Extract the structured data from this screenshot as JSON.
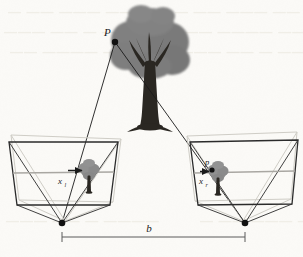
{
  "figure": {
    "type": "geometry-diagram",
    "background_color": "#fbfaf7",
    "width": 303,
    "height": 257
  },
  "labels": {
    "scene_point": "P",
    "image_point_right": "p",
    "baseline": "b",
    "disparity_left_base": "x",
    "disparity_left_sub": "l",
    "disparity_right_base": "x",
    "disparity_right_sub": "r"
  },
  "colors": {
    "ink": "#1a1a1a",
    "frustum_stroke": "#2b2b2b",
    "ghost_stroke": "#cfcdc6",
    "canopy_gray": "#7d7d7d",
    "canopy_gray_light": "#8d8d8d",
    "trunk_dark": "#2a2722",
    "axis_gray": "#a9a7a2",
    "baseline_stroke": "#5a5a5a",
    "paper": "#fbfaf7",
    "bleed": "#efede6"
  },
  "geometry": {
    "scene_point_xy": [
      115,
      42
    ],
    "tree_canopy_center": [
      150,
      46
    ],
    "tree_trunk_base": [
      150,
      126
    ],
    "left_camera_center": [
      62,
      223
    ],
    "right_camera_center": [
      245,
      223
    ],
    "baseline_y": 237,
    "baseline_x_start": 62,
    "baseline_x_end": 245,
    "left_frustum_box": [
      8,
      140,
      118,
      205
    ],
    "right_frustum_box": [
      190,
      140,
      298,
      205
    ],
    "left_image_tree_xy": [
      89,
      170
    ],
    "right_image_tree_xy": [
      218,
      172
    ]
  },
  "background_bleed": {
    "visible": true,
    "description": "faint reversed show-through text from the opposite page",
    "rows": [
      "—  ——  ———   ——",
      "———   ——  —   ————",
      "——  ————   ——  ———"
    ]
  }
}
